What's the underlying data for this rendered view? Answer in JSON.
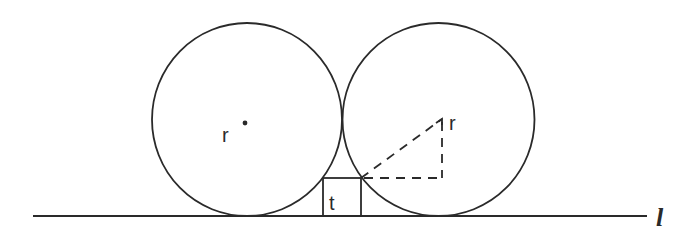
{
  "diagram": {
    "type": "geometry",
    "colors": {
      "stroke": "#2a2a2a",
      "background": "#ffffff"
    },
    "labels": {
      "left_radius": "r",
      "right_radius": "r",
      "square_side": "t",
      "line": "l"
    },
    "circles": [
      {
        "name": "left-circle",
        "cx": 247,
        "cy": 119.5,
        "rx": 95,
        "ry": 96.5
      },
      {
        "name": "right-circle",
        "cx": 438.5,
        "cy": 119.5,
        "rx": 96,
        "ry": 96.5
      }
    ],
    "square": {
      "x": 323,
      "y": 178,
      "width": 38,
      "height": 38
    },
    "baseline": {
      "x1": 33,
      "y1": 216,
      "x2": 647,
      "y2": 216
    },
    "right_triangle_dashed": {
      "vertex_square_corner": [
        361,
        178
      ],
      "vertex_center": [
        442,
        119
      ],
      "vertex_right_angle": [
        442,
        178
      ]
    }
  }
}
